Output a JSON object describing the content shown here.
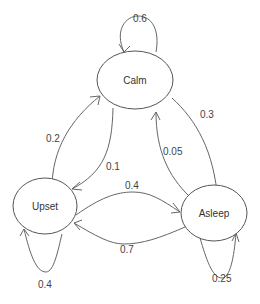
{
  "diagram": {
    "type": "state-transition",
    "nodes": [
      {
        "id": "calm",
        "label": "Calm"
      },
      {
        "id": "upset",
        "label": "Upset"
      },
      {
        "id": "asleep",
        "label": "Asleep"
      }
    ],
    "edges": [
      {
        "from": "calm",
        "to": "calm",
        "label": "0.6"
      },
      {
        "from": "calm",
        "to": "asleep",
        "label": "0.3"
      },
      {
        "from": "calm",
        "to": "upset",
        "label": "0.1"
      },
      {
        "from": "upset",
        "to": "calm",
        "label": "0.2"
      },
      {
        "from": "upset",
        "to": "asleep",
        "label": "0.4"
      },
      {
        "from": "upset",
        "to": "upset",
        "label": "0.4"
      },
      {
        "from": "asleep",
        "to": "calm",
        "label": "0.05"
      },
      {
        "from": "asleep",
        "to": "upset",
        "label": "0.7"
      },
      {
        "from": "asleep",
        "to": "asleep",
        "label": "0.25"
      }
    ]
  }
}
